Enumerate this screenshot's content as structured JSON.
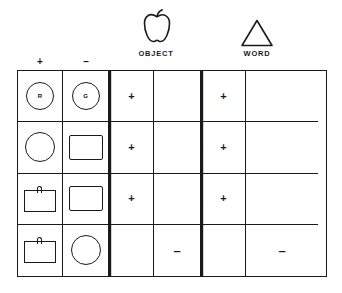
{
  "figure": {
    "headers": {
      "sign_plus": "+",
      "sign_minus": "–",
      "object_caption": "OBJECT",
      "word_caption": "WORD",
      "object_icon": "apple-icon",
      "word_icon": "triangle-icon"
    },
    "columns": [
      {
        "key": "stim_plus",
        "header": "+",
        "group": ""
      },
      {
        "key": "stim_minus",
        "header": "–",
        "group": ""
      },
      {
        "key": "object_a",
        "header": "",
        "group": "OBJECT"
      },
      {
        "key": "object_b",
        "header": "",
        "group": "OBJECT"
      },
      {
        "key": "word_a",
        "header": "",
        "group": "WORD"
      },
      {
        "key": "word_b",
        "header": "",
        "group": "WORD"
      }
    ],
    "rows": [
      {
        "stim_plus": {
          "shape": "circle-with-letter",
          "label": "R"
        },
        "stim_minus": {
          "shape": "circle-with-letter",
          "label": "G"
        },
        "object_a": "+",
        "object_b": "",
        "word_a": "+",
        "word_b": ""
      },
      {
        "stim_plus": {
          "shape": "circle",
          "label": ""
        },
        "stim_minus": {
          "shape": "rectangle",
          "label": ""
        },
        "object_a": "+",
        "object_b": "",
        "word_a": "+",
        "word_b": ""
      },
      {
        "stim_plus": {
          "shape": "pot",
          "label": ""
        },
        "stim_minus": {
          "shape": "rectangle",
          "label": ""
        },
        "object_a": "+",
        "object_b": "",
        "word_a": "+",
        "word_b": ""
      },
      {
        "stim_plus": {
          "shape": "pot",
          "label": ""
        },
        "stim_minus": {
          "shape": "circle",
          "label": ""
        },
        "object_a": "",
        "object_b": "–",
        "word_a": "",
        "word_b": "–"
      }
    ],
    "colors": {
      "ink": "#1a1a1a",
      "paper": "#ffffff"
    }
  }
}
